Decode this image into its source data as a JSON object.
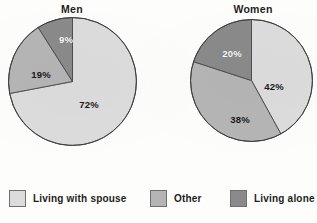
{
  "figure": {
    "background_color": "#fdfdfc"
  },
  "legend": {
    "position": "bottom",
    "entries": [
      {
        "label": "Living  with spouse",
        "color": "#dcdcdc",
        "key": "living-with-spouse"
      },
      {
        "label": "Other",
        "color": "#b5b5b5",
        "key": "other"
      },
      {
        "label": "Living alone",
        "color": "#8a8a8a",
        "key": "living-alone"
      }
    ]
  },
  "chart_data": [
    {
      "type": "pie",
      "title": "Men",
      "labels": [
        "Living  with spouse",
        "Other",
        "Living alone"
      ],
      "values": [
        72,
        19,
        9
      ],
      "value_labels": [
        "72%",
        "19%",
        "9%"
      ],
      "colors": [
        "#dcdcdc",
        "#b5b5b5",
        "#8a8a8a"
      ],
      "units": "percent",
      "total": 100,
      "start_angle_deg": 0,
      "direction": "clockwise",
      "grid": false,
      "xlabel": "",
      "ylabel": ""
    },
    {
      "type": "pie",
      "title": "Women",
      "labels": [
        "Living  with spouse",
        "Other",
        "Living alone"
      ],
      "values": [
        42,
        38,
        20
      ],
      "value_labels": [
        "42%",
        "38%",
        "20%"
      ],
      "colors": [
        "#dcdcdc",
        "#b5b5b5",
        "#8a8a8a"
      ],
      "units": "percent",
      "total": 100,
      "start_angle_deg": 0,
      "direction": "clockwise",
      "grid": false,
      "xlabel": "",
      "ylabel": ""
    }
  ]
}
